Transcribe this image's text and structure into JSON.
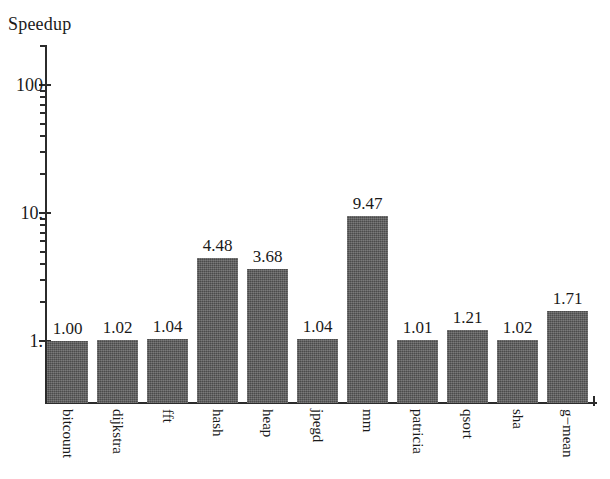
{
  "chart_data": {
    "type": "bar",
    "title": "Speedup",
    "xlabel": "",
    "ylabel": "Speedup",
    "yscale": "log",
    "ylim": [
      0.55,
      200
    ],
    "grid": false,
    "legend": "none",
    "axis_tick_labels": [
      "100",
      "10.",
      "1."
    ],
    "axis_tick_values": [
      100,
      10,
      1
    ],
    "categories": [
      "bitcount",
      "dijkstra",
      "fft",
      "hash",
      "heap",
      "jpegd",
      "mm",
      "patricia",
      "qsort",
      "sha",
      "g−mean"
    ],
    "values": [
      1.0,
      1.02,
      1.04,
      4.48,
      3.68,
      1.04,
      9.47,
      1.01,
      1.21,
      1.02,
      1.71
    ],
    "value_labels": [
      "1.00",
      "1.02",
      "1.04",
      "4.48",
      "3.68",
      "1.04",
      "9.47",
      "1.01",
      "1.21",
      "1.02",
      "1.71"
    ],
    "bar_color": "#5c5c5c",
    "axis_color": "#2b2b2b"
  },
  "layout": {
    "plot_left": 45,
    "plot_right": 597,
    "baseline_y": 403,
    "axis_top": 45,
    "decade_px": 128,
    "one_y": 341,
    "bar_width": 41,
    "bar_pitch": 50,
    "bar_start_x": 47
  }
}
